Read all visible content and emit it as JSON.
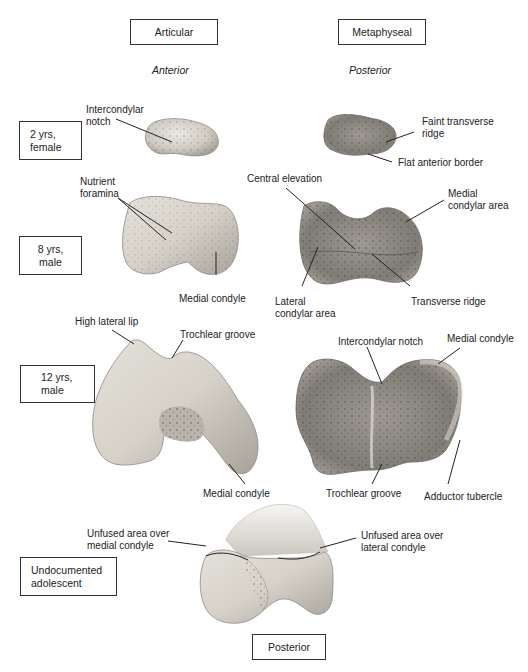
{
  "columns": {
    "articular": "Articular",
    "metaphyseal": "Metaphyseal",
    "anterior": "Anterior",
    "posterior_view": "Posterior"
  },
  "rows": [
    {
      "line1": "2 yrs,",
      "line2": "female"
    },
    {
      "line1": "8 yrs,",
      "line2": "male"
    },
    {
      "line1": "12 yrs,",
      "line2": "male"
    },
    {
      "line1": "Undocumented",
      "line2": "adolescent"
    }
  ],
  "bottom_label": "Posterior",
  "labels": {
    "r1_left": {
      "line1": "Intercondylar",
      "line2": "notch"
    },
    "r1_right_a": {
      "line1": "Faint transverse",
      "line2": "ridge"
    },
    "r1_right_b": "Flat anterior border",
    "r2_left_a": {
      "line1": "Nutrient",
      "line2": "foramina"
    },
    "r2_left_b": "Medial condyle",
    "r2_right_a": "Central elevation",
    "r2_right_b": {
      "line1": "Medial",
      "line2": "condylar area"
    },
    "r2_right_c": {
      "line1": "Lateral",
      "line2": "condylar area"
    },
    "r2_right_d": "Transverse ridge",
    "r3_left_a": "High lateral lip",
    "r3_left_b": "Trochlear groove",
    "r3_left_c": "Medial condyle",
    "r3_right_a": "Intercondylar notch",
    "r3_right_b": "Medial condyle",
    "r3_right_c": "Trochlear groove",
    "r3_right_d": "Adductor tubercle",
    "r4_a": {
      "line1": "Unfused area over",
      "line2": "medial condyle"
    },
    "r4_b": {
      "line1": "Unfused area over",
      "line2": "lateral condyle"
    }
  },
  "colors": {
    "bone_light": "#e6e3dc",
    "bone_mid": "#bdb8ae",
    "bone_dark": "#8e8a83",
    "line": "#222222"
  }
}
